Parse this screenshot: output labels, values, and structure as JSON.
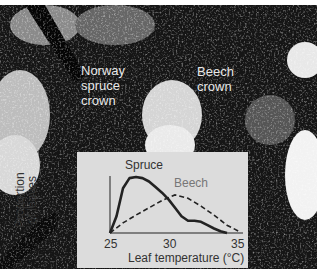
{
  "photo": {
    "labels": {
      "spruce_crown": [
        "Norway",
        "spruce",
        "crown"
      ],
      "beech_crown": [
        "Beech",
        "crown"
      ]
    }
  },
  "chart_data": {
    "type": "line",
    "title": "",
    "xlabel": "Leaf temperature (°C)",
    "ylabel": "Proportion of leaves",
    "x_ticks": [
      "25",
      "30",
      "35"
    ],
    "xlim": [
      25,
      35
    ],
    "grid": false,
    "legend": "inline labels",
    "series": [
      {
        "name": "Spruce",
        "style": "solid",
        "x": [
          25,
          25.5,
          26,
          26.5,
          27,
          27.5,
          28,
          28.5,
          29,
          29.5,
          30,
          30.5,
          31,
          31.5,
          32,
          32.5,
          33,
          33.5,
          34
        ],
        "values": [
          0,
          0.3,
          0.8,
          0.98,
          1.0,
          0.98,
          0.92,
          0.82,
          0.72,
          0.6,
          0.45,
          0.3,
          0.22,
          0.22,
          0.2,
          0.14,
          0.08,
          0.03,
          0
        ]
      },
      {
        "name": "Beech",
        "style": "dashed",
        "x": [
          25,
          26,
          27,
          28,
          29,
          30,
          31,
          32,
          33,
          34,
          35
        ],
        "values": [
          0,
          0.18,
          0.32,
          0.45,
          0.58,
          0.68,
          0.62,
          0.48,
          0.32,
          0.14,
          0.02
        ]
      }
    ]
  },
  "chart_text": {
    "series_spruce": "Spruce",
    "series_beech": "Beech",
    "ylabel_line1": "Proportion",
    "ylabel_line2": "of leaves",
    "tick_25": "25",
    "tick_30": "30",
    "tick_35": "35",
    "xlabel": "Leaf temperature (°C)"
  }
}
